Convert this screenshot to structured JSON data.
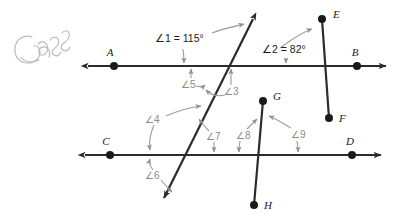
{
  "figure": {
    "kind": "geometry-diagram",
    "stroke_color": "#2b2b2b",
    "label_color": "#1a1a1a",
    "angle_label_color": "#8a8a8a",
    "annotation_color": "#b9b6c4",
    "background": "#ffffff"
  },
  "annotation": {
    "handwriting_text": "Class"
  },
  "points": [
    {
      "id": "A",
      "label": "A",
      "x": 114,
      "y": 66
    },
    {
      "id": "B",
      "label": "B",
      "x": 357,
      "y": 66
    },
    {
      "id": "C",
      "label": "C",
      "x": 110,
      "y": 155
    },
    {
      "id": "D",
      "label": "D",
      "x": 352,
      "y": 155
    },
    {
      "id": "E",
      "label": "E",
      "x": 322,
      "y": 19
    },
    {
      "id": "F",
      "label": "F",
      "x": 329,
      "y": 118
    },
    {
      "id": "G",
      "label": "G",
      "x": 263,
      "y": 101
    },
    {
      "id": "H",
      "label": "H",
      "x": 254,
      "y": 205
    }
  ],
  "lines": [
    {
      "id": "line-AB",
      "name": "line-ab",
      "x1": 88,
      "y1": 66,
      "x2": 386,
      "y2": 66,
      "arrows": "both"
    },
    {
      "id": "line-CD",
      "name": "line-cd",
      "x1": 85,
      "y1": 155,
      "x2": 381,
      "y2": 155,
      "arrows": "both"
    },
    {
      "id": "transversal",
      "name": "transversal-line",
      "x1": 253,
      "y1": 19,
      "x2": 164,
      "y2": 198,
      "arrows": "both"
    },
    {
      "id": "segment-EF",
      "name": "segment-ef",
      "x1": 322,
      "y1": 19,
      "x2": 329,
      "y2": 118,
      "arrows": "none"
    },
    {
      "id": "segment-GH",
      "name": "segment-gh",
      "x1": 263,
      "y1": 101,
      "x2": 254,
      "y2": 205,
      "arrows": "none"
    }
  ],
  "angles": [
    {
      "id": "1",
      "label": "∠1 = 115°",
      "short": "∠1",
      "measure": "115°",
      "x": 155,
      "y": 42,
      "has_measure": true
    },
    {
      "id": "2",
      "label": "∠2 = 82°",
      "short": "∠2",
      "measure": "82°",
      "x": 262,
      "y": 53,
      "has_measure": true
    },
    {
      "id": "3",
      "label": "∠3",
      "short": "∠3",
      "measure": "",
      "x": 228,
      "y": 92,
      "has_measure": false
    },
    {
      "id": "4",
      "label": "∠4",
      "short": "∠4",
      "measure": "",
      "x": 148,
      "y": 120,
      "has_measure": false
    },
    {
      "id": "5",
      "label": "∠5",
      "short": "∠5",
      "measure": "",
      "x": 187,
      "y": 85,
      "has_measure": false
    },
    {
      "id": "6",
      "label": "∠6",
      "short": "∠6",
      "measure": "",
      "x": 148,
      "y": 174,
      "has_measure": false
    },
    {
      "id": "7",
      "label": "∠7",
      "short": "∠7",
      "measure": "",
      "x": 212,
      "y": 136,
      "has_measure": false
    },
    {
      "id": "8",
      "label": "∠8",
      "short": "∠8",
      "measure": "",
      "x": 242,
      "y": 135,
      "has_measure": false
    },
    {
      "id": "9",
      "label": "∠9",
      "short": "∠9",
      "measure": "",
      "x": 295,
      "y": 134,
      "has_measure": false
    }
  ]
}
